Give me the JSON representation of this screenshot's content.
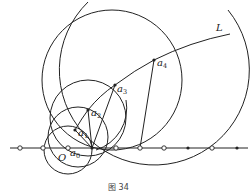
{
  "figure": {
    "caption": "图 34",
    "curve_label": "L",
    "origin_label": "O",
    "points": [
      {
        "name": "a",
        "sub": "0"
      },
      {
        "name": "a",
        "sub": "1"
      },
      {
        "name": "a",
        "sub": "2"
      },
      {
        "name": "a",
        "sub": "3"
      },
      {
        "name": "a",
        "sub": "4"
      }
    ],
    "axis_markers": [
      "open",
      "open",
      "open",
      "filled",
      "open",
      "open",
      "open",
      "filled",
      "open",
      "filled"
    ],
    "colors": {
      "stroke": "#222222",
      "background": "#ffffff"
    }
  }
}
